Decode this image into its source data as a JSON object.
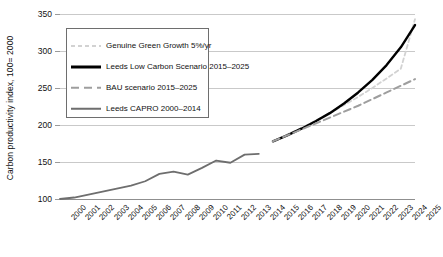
{
  "chart_data": {
    "type": "line",
    "title": "",
    "xlabel": "",
    "ylabel": "Carbon productivity index, 100= 2000",
    "ylim": [
      100,
      350
    ],
    "yticks": [
      100,
      150,
      200,
      250,
      300,
      350
    ],
    "grid": true,
    "legend_position": "upper-left-inside",
    "categories": [
      "2000",
      "2001",
      "2002",
      "2003",
      "2004",
      "2005",
      "2006",
      "2007",
      "2008",
      "2009",
      "2010",
      "2011",
      "2012",
      "2013",
      "2014",
      "2015",
      "2016",
      "2017",
      "2018",
      "2019",
      "2020",
      "2021",
      "2022",
      "2023",
      "2024",
      "2025"
    ],
    "series": [
      {
        "name": "Genuine Green Growth 5%/yr",
        "style": "fine-dashed",
        "color": "#d2d2d2",
        "x": [
          "2015",
          "2016",
          "2017",
          "2018",
          "2019",
          "2020",
          "2021",
          "2022",
          "2023",
          "2024",
          "2025"
        ],
        "values": [
          178,
          187,
          196,
          206,
          216,
          227,
          238,
          250,
          263,
          276,
          343
        ]
      },
      {
        "name": "Leeds Low Carbon Scenario 2015–2025",
        "style": "solid-thick",
        "color": "#000000",
        "x": [
          "2015",
          "2016",
          "2017",
          "2018",
          "2019",
          "2020",
          "2021",
          "2022",
          "2023",
          "2024",
          "2025"
        ],
        "values": [
          178,
          186,
          195,
          205,
          216,
          229,
          244,
          261,
          281,
          305,
          335
        ]
      },
      {
        "name": "BAU scenario 2015–2025",
        "style": "dashed",
        "color": "#9e9e9e",
        "x": [
          "2015",
          "2016",
          "2017",
          "2018",
          "2019",
          "2020",
          "2021",
          "2022",
          "2023",
          "2024",
          "2025"
        ],
        "values": [
          178,
          186,
          194,
          202,
          210,
          218,
          226,
          235,
          244,
          253,
          262
        ]
      },
      {
        "name": "Leeds CAPRO 2000–2014",
        "style": "solid",
        "color": "#6e6e6e",
        "x": [
          "2000",
          "2001",
          "2002",
          "2003",
          "2004",
          "2005",
          "2006",
          "2007",
          "2008",
          "2009",
          "2010",
          "2011",
          "2012",
          "2013",
          "2014"
        ],
        "values": [
          100,
          102,
          106,
          110,
          114,
          118,
          124,
          134,
          137,
          133,
          142,
          152,
          149,
          160,
          161
        ]
      }
    ],
    "legend": [
      {
        "label": "Genuine Green Growth 5%/yr",
        "swatch": "sw-ggg"
      },
      {
        "label": "Leeds Low Carbon Scenario 2015–2025",
        "swatch": "sw-llc"
      },
      {
        "label": "BAU scenario 2015–2025",
        "swatch": "sw-bau"
      },
      {
        "label": "Leeds CAPRO 2000–2014",
        "swatch": "sw-cap"
      }
    ]
  }
}
